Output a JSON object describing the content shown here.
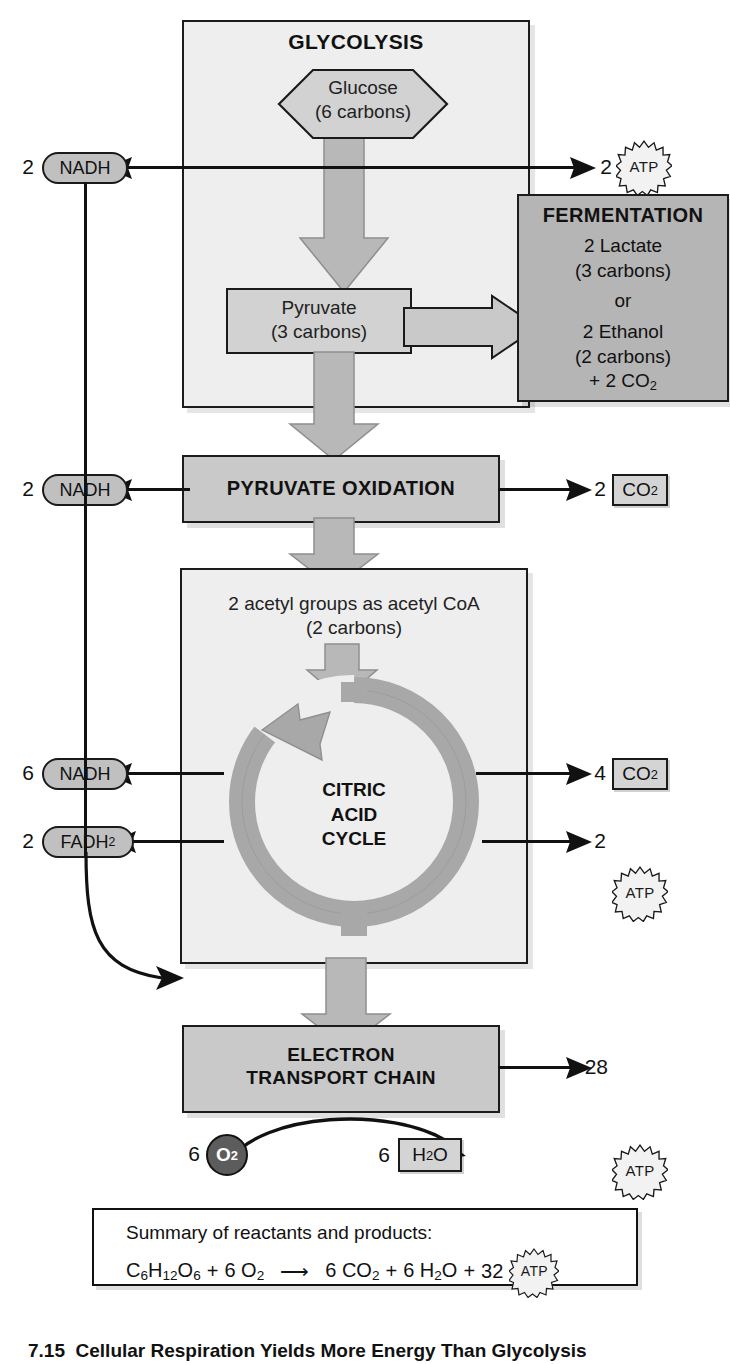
{
  "figure": {
    "caption_number": "7.15",
    "caption_text": "Cellular Respiration Yields More Energy Than Glycolysis"
  },
  "glycolysis": {
    "title": "GLYCOLYSIS",
    "substrate_name": "Glucose",
    "substrate_carbons": "(6 carbons)",
    "product_name": "Pyruvate",
    "product_carbons": "(3 carbons)"
  },
  "fermentation": {
    "title": "FERMENTATION",
    "line1": "2 Lactate",
    "line2": "(3 carbons)",
    "line3": "or",
    "line4": "2 Ethanol",
    "line5": "(2 carbons)",
    "line6_prefix": "+ 2 CO",
    "line6_sub": "2"
  },
  "pyruvate_oxidation": {
    "title": "PYRUVATE OXIDATION"
  },
  "citric_acid_cycle": {
    "input_line1": "2 acetyl groups as acetyl CoA",
    "input_line2": "(2 carbons)",
    "title_line1": "CITRIC",
    "title_line2": "ACID",
    "title_line3": "CYCLE"
  },
  "electron_transport_chain": {
    "title_line1": "ELECTRON",
    "title_line2": "TRANSPORT CHAIN"
  },
  "outputs": {
    "glycolysis_nadh": {
      "coefficient": "2",
      "label": "NADH"
    },
    "glycolysis_atp": {
      "coefficient": "2",
      "label": "ATP"
    },
    "pyrox_nadh": {
      "coefficient": "2",
      "label": "NADH"
    },
    "pyrox_co2": {
      "coefficient": "2",
      "label_prefix": "CO",
      "label_sub": "2"
    },
    "cac_nadh": {
      "coefficient": "6",
      "label": "NADH"
    },
    "cac_fadh2": {
      "coefficient": "2",
      "label_prefix": "FADH",
      "label_sub": "2"
    },
    "cac_co2": {
      "coefficient": "4",
      "label_prefix": "CO",
      "label_sub": "2"
    },
    "cac_atp": {
      "coefficient": "2",
      "label": "ATP"
    },
    "etc_atp": {
      "coefficient": "28",
      "label": "ATP"
    },
    "oxygen_in": {
      "coefficient": "6",
      "label_prefix": "O",
      "label_sub": "2"
    },
    "water_out": {
      "coefficient": "6",
      "label_prefix": "H",
      "label_sub": "2",
      "label_suffix": "O"
    }
  },
  "summary": {
    "heading": "Summary of reactants and products:",
    "reactant_glucose_prefix": "C",
    "reactant_glucose_s1": "6",
    "reactant_glucose_m1": "H",
    "reactant_glucose_s2": "12",
    "reactant_glucose_m2": "O",
    "reactant_glucose_s3": "6",
    "plus1": "+",
    "reactant_o2_coef": "6",
    "reactant_o2": "O",
    "reactant_o2_sub": "2",
    "arrow": "⟶",
    "product_co2_coef": "6",
    "product_co2": "CO",
    "product_co2_sub": "2",
    "plus2": "+",
    "product_h2o_coef": "6",
    "product_h2o_h": "H",
    "product_h2o_sub": "2",
    "product_h2o_o": "O",
    "plus3": "+",
    "product_atp_coef": "32",
    "product_atp": "ATP"
  },
  "colors": {
    "panel_light": "#eeeeee",
    "panel_mid": "#c9c9c9",
    "panel_dark": "#b5b5b5",
    "flow_arrow": "#b8b8b8",
    "carrier_fill": "#c0c0c0",
    "oxygen_fill": "#5c5c5c",
    "stroke": "#1a1a1a"
  }
}
